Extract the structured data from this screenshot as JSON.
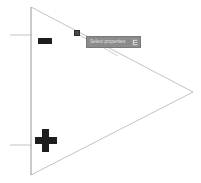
{
  "canvas": {
    "width": 201,
    "height": 183,
    "background_color": "#ffffff"
  },
  "shape": {
    "name": "right-pointing-triangle",
    "stroke_color": "#b4b4b4",
    "stroke_width": 0.8,
    "vertices": [
      {
        "label": "top-left",
        "x": 31,
        "y": 7
      },
      {
        "label": "right-apex",
        "x": 193,
        "y": 92
      },
      {
        "label": "bottom-left",
        "x": 31,
        "y": 175
      }
    ]
  },
  "axis": {
    "vertical_edge": {
      "x": 31,
      "y1": 7,
      "y2": 175,
      "color": "#b4b4b4"
    },
    "ticks": [
      {
        "name": "upper-tick",
        "x1": 10,
        "x2": 32,
        "y": 35,
        "color": "#b4b4b4"
      },
      {
        "name": "lower-tick",
        "x1": 10,
        "x2": 32,
        "y": 145,
        "color": "#b4b4b4"
      }
    ]
  },
  "glyphs": {
    "negative": {
      "symbol": "−",
      "label": "minus",
      "color": "#1d1d1d"
    },
    "positive": {
      "symbol": "+",
      "label": "plus",
      "color": "#1d1d1d"
    }
  },
  "handle": {
    "label": "edge-control-point",
    "x": 76,
    "y": 32,
    "color": "#4a4a4a"
  },
  "tooltip": {
    "text": "Select properties",
    "icon": "menu-icon",
    "background_color": "#8c8c8c",
    "text_color": "#e2e2e2",
    "connector_color": "#b4b4b4"
  }
}
